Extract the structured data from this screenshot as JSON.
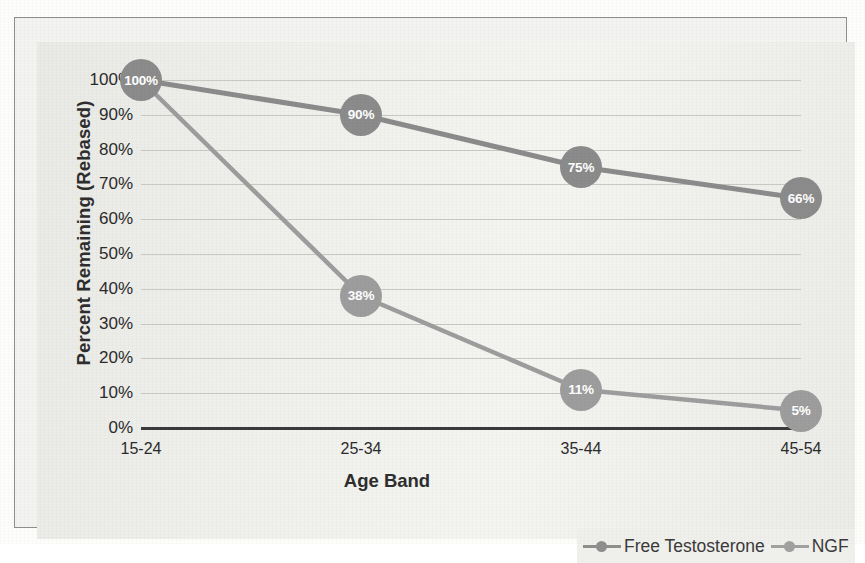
{
  "chart_data": {
    "type": "line",
    "title": "",
    "xlabel": "Age Band",
    "ylabel": "Percent Remaining (Rebased)",
    "categories": [
      "15-24",
      "25-34",
      "35-44",
      "45-54"
    ],
    "ylim": [
      0,
      100
    ],
    "ytick_labels": [
      "100%",
      "90%",
      "80%",
      "70%",
      "60%",
      "50%",
      "40%",
      "30%",
      "20%",
      "10%",
      "0%"
    ],
    "ytick_values": [
      100,
      90,
      80,
      70,
      60,
      50,
      40,
      30,
      20,
      10,
      0
    ],
    "grid": true,
    "legend_position": "bottom-right",
    "series": [
      {
        "name": "Free Testosterone",
        "color": "#8b8b8b",
        "values": [
          100,
          90,
          75,
          66
        ],
        "data_labels": [
          "100%",
          "90%",
          "75%",
          "66%"
        ]
      },
      {
        "name": "NGF",
        "color": "#9d9d9d",
        "values": [
          100,
          38,
          11,
          5
        ],
        "data_labels": [
          "100%",
          "38%",
          "11%",
          "5%"
        ]
      }
    ]
  },
  "legend": {
    "items": [
      {
        "label": "Free Testosterone"
      },
      {
        "label": "NGF"
      }
    ]
  }
}
